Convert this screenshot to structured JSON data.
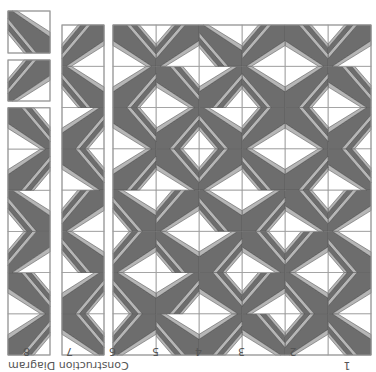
{
  "diagram": {
    "title": "Construction Diagram",
    "orientation": "rotated 180 degrees",
    "colors": {
      "background": "#ffffff",
      "dark": "#6d6d6d",
      "light": "#b6b6b6",
      "outline": "#4a4a4a",
      "grid": "#9a9a9a",
      "label": "#555555"
    },
    "column_labels": [
      "1",
      "2",
      "3",
      "4",
      "5",
      "6",
      "7",
      "8"
    ],
    "main_grid": {
      "columns": 6,
      "rows": 8,
      "x": 5,
      "y": 13,
      "cell_w": 43,
      "cell_h": 41.25,
      "dark_corners": [
        [
          "TL",
          "BL",
          "BR",
          "TR",
          "TL",
          "BL"
        ],
        [
          "BL",
          "TL",
          "BL",
          "BR",
          "TR",
          "TL"
        ],
        [
          "TL",
          "BL",
          "BR",
          "TR",
          "TL",
          "BL"
        ],
        [
          "BL",
          "BR",
          "TR",
          "TL",
          "BL",
          "TL"
        ],
        [
          "BR",
          "TR",
          "TL",
          "BL",
          "BR",
          "TR"
        ],
        [
          "TR",
          "BR",
          "BL",
          "TL",
          "TR",
          "BR"
        ],
        [
          "BR",
          "TR",
          "TL",
          "TR",
          "BR",
          "TR"
        ],
        [
          "BL",
          "BR",
          "BL",
          "TL",
          "BL",
          "BR"
        ]
      ]
    },
    "strip_2": {
      "x": 272,
      "y": 13,
      "cell_w": 42,
      "cell_h": 41.25,
      "rows": 8,
      "dark_corners": [
        "BR",
        "TR",
        "TL",
        "BL",
        "BR",
        "TR",
        "TL",
        "BL"
      ]
    },
    "strip_1": {
      "x": 326,
      "y": 13,
      "cell_w": 42,
      "cell_h": 41.2,
      "rows": 6,
      "dark_corners": [
        "TR",
        "BR",
        "BL",
        "TL",
        "TR",
        "BR"
      ],
      "separate_blocks": [
        {
          "y": 267,
          "h": 41,
          "dark_corner": "BL"
        },
        {
          "y": 315,
          "h": 42,
          "dark_corner": "TL"
        }
      ]
    }
  }
}
